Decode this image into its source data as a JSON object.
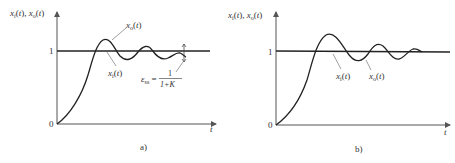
{
  "figure": {
    "panels": [
      {
        "id": "a",
        "caption": "a)",
        "y_axis_label": "x_i(t), x_o(t)",
        "x_axis_label": "t",
        "tick_zero": "0",
        "tick_one": "1",
        "curve_label_output": "x_o(t)",
        "curve_label_input": "x_i(t)",
        "error_label": "ε_ss =",
        "error_numerator": "1",
        "error_denominator": "1+K",
        "note": "output settles below input; steady-state error 1/(1+K)"
      },
      {
        "id": "b",
        "caption": "b)",
        "y_axis_label": "x_i(t), x_o(t)",
        "x_axis_label": "t",
        "tick_zero": "0",
        "tick_one": "1",
        "curve_label_input": "x_i(t)",
        "curve_label_output": "x_o(t)",
        "note": "output oscillates and converges to input (zero steady-state error)"
      }
    ]
  },
  "colors": {
    "axis": "#555555",
    "curve": "#222222",
    "leader": "#777777"
  }
}
